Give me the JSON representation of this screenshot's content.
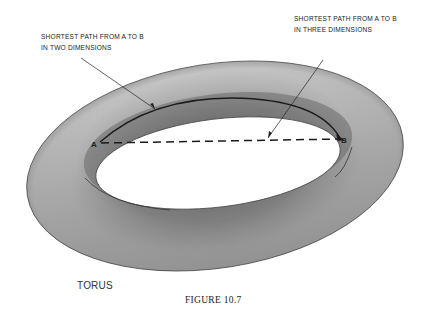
{
  "figure": {
    "caption": "FIGURE 10.7",
    "object_label": "TORUS",
    "annotations": {
      "two_dimensions": {
        "line1": "SHORTEST PATH FROM A TO B",
        "line2": "IN TWO DIMENSIONS"
      },
      "three_dimensions": {
        "line1": "SHORTEST PATH FROM A TO B",
        "line2": "IN THREE DIMENSIONS"
      }
    },
    "points": {
      "a": "A",
      "b": "B"
    },
    "colors": {
      "torus_light": "#c8c8c8",
      "torus_mid": "#a9a9a9",
      "torus_dark": "#6e6e6e",
      "line": "#222222",
      "background": "#ffffff"
    }
  }
}
